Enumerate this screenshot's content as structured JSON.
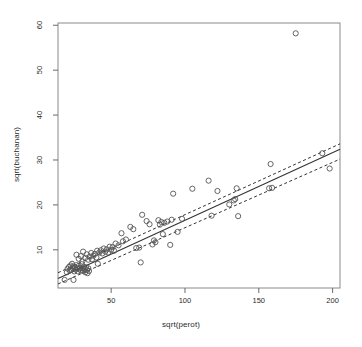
{
  "chart_data": {
    "type": "scatter",
    "title": "",
    "xlabel": "sqrt(perot)",
    "ylabel": "sqrt(buchanan)",
    "xlim": [
      14,
      205
    ],
    "ylim": [
      1.5,
      60.5
    ],
    "xticks": [
      50,
      100,
      150,
      200
    ],
    "yticks": [
      10,
      20,
      30,
      40,
      50,
      60
    ],
    "grid": false,
    "legend": null,
    "marker": "open-circle",
    "marker_color": "#555555",
    "line_color": "#333333",
    "points": [
      [
        18.5,
        3.3
      ],
      [
        24.5,
        3.3
      ],
      [
        20.0,
        5.0
      ],
      [
        20.5,
        5.8
      ],
      [
        21.5,
        6.2
      ],
      [
        22.0,
        5.4
      ],
      [
        22.5,
        6.5
      ],
      [
        23.0,
        5.6
      ],
      [
        23.5,
        6.9
      ],
      [
        24.0,
        5.9
      ],
      [
        24.5,
        6.3
      ],
      [
        25.0,
        5.2
      ],
      [
        25.5,
        6.1
      ],
      [
        26.0,
        5.6
      ],
      [
        26.5,
        6.6
      ],
      [
        27.0,
        5.9
      ],
      [
        27.5,
        5.2
      ],
      [
        28.0,
        6.4
      ],
      [
        28.5,
        5.7
      ],
      [
        29.0,
        6.0
      ],
      [
        29.5,
        5.4
      ],
      [
        30.0,
        6.8
      ],
      [
        30.5,
        5.9
      ],
      [
        31.0,
        5.3
      ],
      [
        31.5,
        6.2
      ],
      [
        32.0,
        5.7
      ],
      [
        32.5,
        5.0
      ],
      [
        33.0,
        6.1
      ],
      [
        33.5,
        5.5
      ],
      [
        34.0,
        4.8
      ],
      [
        34.5,
        5.9
      ],
      [
        35.0,
        5.3
      ],
      [
        28.0,
        8.0
      ],
      [
        29.5,
        8.6
      ],
      [
        30.5,
        7.4
      ],
      [
        26.5,
        8.9
      ],
      [
        31.0,
        9.6
      ],
      [
        32.5,
        8.2
      ],
      [
        33.5,
        9.0
      ],
      [
        34.5,
        7.8
      ],
      [
        35.5,
        8.5
      ],
      [
        36.5,
        9.3
      ],
      [
        37.0,
        7.9
      ],
      [
        38.0,
        8.7
      ],
      [
        39.0,
        9.1
      ],
      [
        40.0,
        8.3
      ],
      [
        40.5,
        9.8
      ],
      [
        41.0,
        6.9
      ],
      [
        42.0,
        9.4
      ],
      [
        43.0,
        9.9
      ],
      [
        44.0,
        9.2
      ],
      [
        45.0,
        10.3
      ],
      [
        46.0,
        9.6
      ],
      [
        47.0,
        10.1
      ],
      [
        48.0,
        9.4
      ],
      [
        49.0,
        10.7
      ],
      [
        50.0,
        10.0
      ],
      [
        51.0,
        10.6
      ],
      [
        52.0,
        9.8
      ],
      [
        53.0,
        11.4
      ],
      [
        55.0,
        11.0
      ],
      [
        57.0,
        13.7
      ],
      [
        58.0,
        11.9
      ],
      [
        60.0,
        12.3
      ],
      [
        63.0,
        15.1
      ],
      [
        65.0,
        14.6
      ],
      [
        67.0,
        10.4
      ],
      [
        69.0,
        10.5
      ],
      [
        70.0,
        7.2
      ],
      [
        71.0,
        17.8
      ],
      [
        74.0,
        16.4
      ],
      [
        76.0,
        15.7
      ],
      [
        78.0,
        11.2
      ],
      [
        79.0,
        12.1
      ],
      [
        80.0,
        11.7
      ],
      [
        82.0,
        16.6
      ],
      [
        83.0,
        15.6
      ],
      [
        84.0,
        16.2
      ],
      [
        85.0,
        13.5
      ],
      [
        86.0,
        16.0
      ],
      [
        88.0,
        16.3
      ],
      [
        90.0,
        11.1
      ],
      [
        91.0,
        16.7
      ],
      [
        92.0,
        22.5
      ],
      [
        95.0,
        14.0
      ],
      [
        98.0,
        16.9
      ],
      [
        105.0,
        23.6
      ],
      [
        116.0,
        25.4
      ],
      [
        118.0,
        17.6
      ],
      [
        122.0,
        23.1
      ],
      [
        130.0,
        20.1
      ],
      [
        133.0,
        21.0
      ],
      [
        134.0,
        21.3
      ],
      [
        135.0,
        23.7
      ],
      [
        136.0,
        17.5
      ],
      [
        158.0,
        29.1
      ],
      [
        157.0,
        23.7
      ],
      [
        159.0,
        23.8
      ],
      [
        175.0,
        58.2
      ],
      [
        193.0,
        31.5
      ],
      [
        198.0,
        28.1
      ]
    ],
    "fit_line": {
      "style": "solid",
      "x": [
        14,
        205
      ],
      "y": [
        3.6,
        32.4
      ]
    },
    "confidence_bands": [
      {
        "style": "dashed",
        "x": [
          14,
          205
        ],
        "y": [
          4.9,
          33.6
        ]
      },
      {
        "style": "dashed",
        "x": [
          14,
          205
        ],
        "y": [
          2.4,
          30.2
        ]
      }
    ]
  }
}
